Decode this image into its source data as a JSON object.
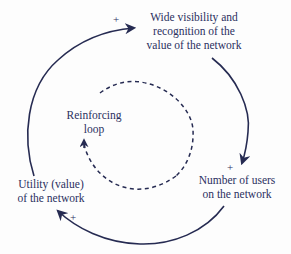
{
  "diagram": {
    "type": "causal-loop",
    "colors": {
      "line": "#262b52",
      "text": "#2b3060",
      "background": "#fdfdfd"
    },
    "nodes": [
      {
        "id": "visibility",
        "lines": [
          "Wide visibility and",
          "recognition of the",
          "value of the network"
        ]
      },
      {
        "id": "users",
        "lines": [
          "Number of users",
          "on the network"
        ]
      },
      {
        "id": "utility",
        "lines": [
          "Utility (value)",
          "of the network"
        ]
      }
    ],
    "center_label": {
      "lines": [
        "Reinforcing",
        "loop"
      ]
    },
    "links": [
      {
        "from": "utility",
        "to": "visibility",
        "polarity": "+"
      },
      {
        "from": "visibility",
        "to": "users",
        "polarity": "+"
      },
      {
        "from": "users",
        "to": "utility",
        "polarity": "+"
      }
    ],
    "loop_type": "reinforcing"
  }
}
